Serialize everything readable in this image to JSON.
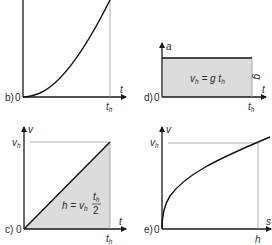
{
  "colors": {
    "axis": "#1a1a1a",
    "curve": "#111111",
    "guide": "#9a9a9a",
    "fill": "#dcdcdc",
    "text": "#2a2a2a"
  },
  "panels": {
    "b": {
      "tag": "b)",
      "origin": "0",
      "x_axis": "t",
      "x_tick": "t",
      "x_tick_sub": "h",
      "curve": "parabola h = g t^2 / 2"
    },
    "d": {
      "tag": "d)",
      "origin": "0",
      "y_axis": "a",
      "x_axis": "t",
      "x_tick": "t",
      "x_tick_sub": "h",
      "level_label": "g",
      "formula": {
        "lhs": "v",
        "lhs_sub": "h",
        "eq": " = g t",
        "rhs_sub": "h"
      }
    },
    "c": {
      "tag": "c)",
      "origin": "0",
      "y_axis": "v",
      "x_axis": "t",
      "y_tick": "v",
      "y_tick_sub": "h",
      "x_tick": "t",
      "x_tick_sub": "h",
      "formula": {
        "lhs": "h = v",
        "lhs_sub": "h",
        "num": "t",
        "num_sub": "h",
        "den": "2"
      }
    },
    "e": {
      "tag": "e)",
      "origin": "0",
      "y_axis": "v",
      "x_axis": "s",
      "y_tick": "v",
      "y_tick_sub": "h",
      "x_tick": "h",
      "curve": "v = sqrt(2 g s)"
    }
  }
}
